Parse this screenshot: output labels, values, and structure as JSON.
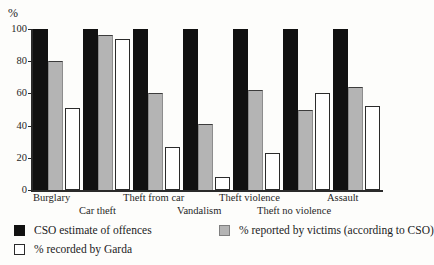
{
  "chart_data": {
    "type": "bar",
    "title": "",
    "subtitle": "",
    "xlabel": "",
    "ylabel": "%",
    "ylim": [
      0,
      100
    ],
    "yticks": [
      0,
      20,
      40,
      60,
      80,
      100
    ],
    "ytick_labels": [
      "0",
      "20",
      "40",
      "60",
      "80",
      "100"
    ],
    "grid": false,
    "legend_position": "bottom-left",
    "categories": [
      "Burglary",
      "Car theft",
      "Theft from car",
      "Vandalism",
      "Theft violence",
      "Theft no violence",
      "Assault"
    ],
    "series": [
      {
        "name": "CSO estimate of offences",
        "color": "#111111",
        "values": [
          100,
          100,
          100,
          100,
          100,
          100,
          100
        ]
      },
      {
        "name": "% reported by victims (according to CSO)",
        "color": "#b4b4b4",
        "values": [
          80,
          96,
          60,
          41,
          62,
          50,
          64
        ]
      },
      {
        "name": "% recorded by Garda",
        "color": "#ffffff",
        "values": [
          51,
          94,
          27,
          8,
          23,
          60,
          52
        ]
      }
    ]
  },
  "axis": {
    "y_unit": "%"
  },
  "legend": {
    "entries": [
      {
        "label": "CSO estimate of offences",
        "swatch": "black-square-swatch"
      },
      {
        "label": "% reported by victims (according to CSO)",
        "swatch": "gray-square-swatch"
      },
      {
        "label": "% recorded by Garda",
        "swatch": "white-square-swatch"
      }
    ]
  }
}
